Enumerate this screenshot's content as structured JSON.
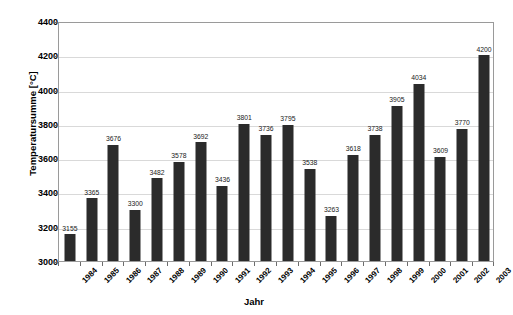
{
  "chart_data": {
    "type": "bar",
    "title": "",
    "subtitle": "",
    "xlabel": "Jahr",
    "ylabel": "Temperatursumme [°C]",
    "categories": [
      "1984",
      "1985",
      "1986",
      "1987",
      "1988",
      "1989",
      "1990",
      "1991",
      "1992",
      "1993",
      "1994",
      "1995",
      "1996",
      "1997",
      "1998",
      "1999",
      "2000",
      "2001",
      "2002",
      "2003"
    ],
    "values": [
      3155,
      3365,
      3676,
      3300,
      3482,
      3578,
      3692,
      3436,
      3801,
      3736,
      3795,
      3538,
      3263,
      3618,
      3738,
      3905,
      4034,
      3609,
      3770,
      4200
    ],
    "data_labels": [
      "3155",
      "3365",
      "3676",
      "3300",
      "3482",
      "3578",
      "3692",
      "3436",
      "3801",
      "3736",
      "3795",
      "3538",
      "3263",
      "3618",
      "3738",
      "3905",
      "4034",
      "3609",
      "3770",
      "4200"
    ],
    "ylim": [
      3000,
      4400
    ],
    "ytick_step": 200,
    "yticks": [
      3000,
      3200,
      3400,
      3600,
      3800,
      4000,
      4200,
      4400
    ],
    "ytick_labels": [
      "3000",
      "3200",
      "3400",
      "3600",
      "3800",
      "4000",
      "4200",
      "4400"
    ],
    "grid": true,
    "grid_axis": "y",
    "legend": false,
    "legend_position": "none",
    "series": [
      {
        "name": "Temperatursumme",
        "color": "#2b2b2b",
        "values": [
          3155,
          3365,
          3676,
          3300,
          3482,
          3578,
          3692,
          3436,
          3801,
          3736,
          3795,
          3538,
          3263,
          3618,
          3738,
          3905,
          4034,
          3609,
          3770,
          4200
        ]
      }
    ],
    "colors": {
      "bar": "#2b2b2b",
      "grid": "#d9d9d9",
      "axis": "#9a9a9a",
      "text": "#000000",
      "background": "#ffffff"
    }
  }
}
